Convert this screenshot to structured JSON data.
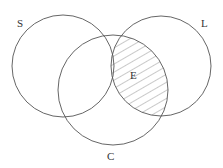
{
  "diagram": {
    "type": "venn",
    "sets": [
      {
        "id": "S",
        "label": "S",
        "cx": 63,
        "cy": 66,
        "r": 51,
        "label_x": 17,
        "label_y": 27
      },
      {
        "id": "L",
        "label": "L",
        "cx": 161,
        "cy": 66,
        "r": 50,
        "label_x": 201,
        "label_y": 27
      },
      {
        "id": "C",
        "label": "C",
        "cx": 113,
        "cy": 90,
        "r": 55,
        "label_x": 107,
        "label_y": 160
      }
    ],
    "shaded_region": {
      "label": "E",
      "sets": [
        "L",
        "C"
      ],
      "label_x": 130,
      "label_y": 79,
      "pattern": "diagonal-hatch"
    },
    "colors": {
      "stroke": "#555555",
      "hatch": "#777777",
      "background": "#ffffff"
    }
  }
}
